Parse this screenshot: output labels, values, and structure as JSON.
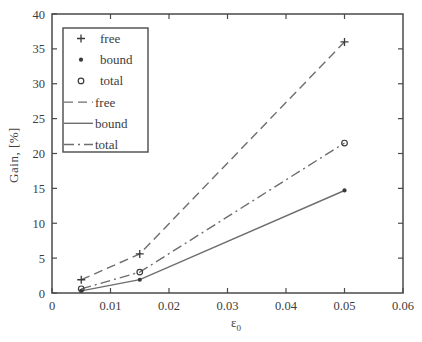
{
  "figure": {
    "background": "#ffffff"
  },
  "chart_data": {
    "type": "line",
    "title": "",
    "xlabel": "ε₀",
    "xlabel_base": "ε",
    "xlabel_sub": "0",
    "ylabel": "Gain, [%]",
    "xlim": [
      0,
      0.06
    ],
    "ylim": [
      0,
      40
    ],
    "xticks": [
      0,
      0.01,
      0.02,
      0.03,
      0.04,
      0.05,
      0.06
    ],
    "xtick_labels": [
      "0",
      "0.01",
      "0.02",
      "0.03",
      "0.04",
      "0.05",
      "0.06"
    ],
    "yticks": [
      0,
      5,
      10,
      15,
      20,
      25,
      30,
      35,
      40
    ],
    "ytick_labels": [
      "0",
      "5",
      "10",
      "15",
      "20",
      "25",
      "30",
      "35",
      "40"
    ],
    "grid": false,
    "box": true,
    "legend_position": "upper-left",
    "legend_entries": [
      {
        "label": "free",
        "kind": "marker",
        "marker": "plus"
      },
      {
        "label": "bound",
        "kind": "marker",
        "marker": "dot"
      },
      {
        "label": "total",
        "kind": "marker",
        "marker": "circle"
      },
      {
        "label": "free",
        "kind": "line",
        "dash": "dashed"
      },
      {
        "label": "bound",
        "kind": "line",
        "dash": "solid"
      },
      {
        "label": "total",
        "kind": "line",
        "dash": "dashdot"
      }
    ],
    "series": [
      {
        "name": "free",
        "dash": "dashed",
        "marker": "plus",
        "x": [
          0.005,
          0.015,
          0.05
        ],
        "y": [
          1.9,
          5.6,
          36.0
        ]
      },
      {
        "name": "bound",
        "dash": "solid",
        "marker": "dot",
        "x": [
          0.005,
          0.015,
          0.05
        ],
        "y": [
          0.3,
          1.9,
          14.7
        ]
      },
      {
        "name": "total",
        "dash": "dashdot",
        "marker": "circle",
        "x": [
          0.005,
          0.015,
          0.05
        ],
        "y": [
          0.6,
          3.0,
          21.5
        ]
      }
    ],
    "colors": {
      "line": "#6e6e6e",
      "marker": "#3a3a3a",
      "axis": "#4a4a4a",
      "text": "#3c3c3c",
      "background": "#ffffff"
    }
  }
}
